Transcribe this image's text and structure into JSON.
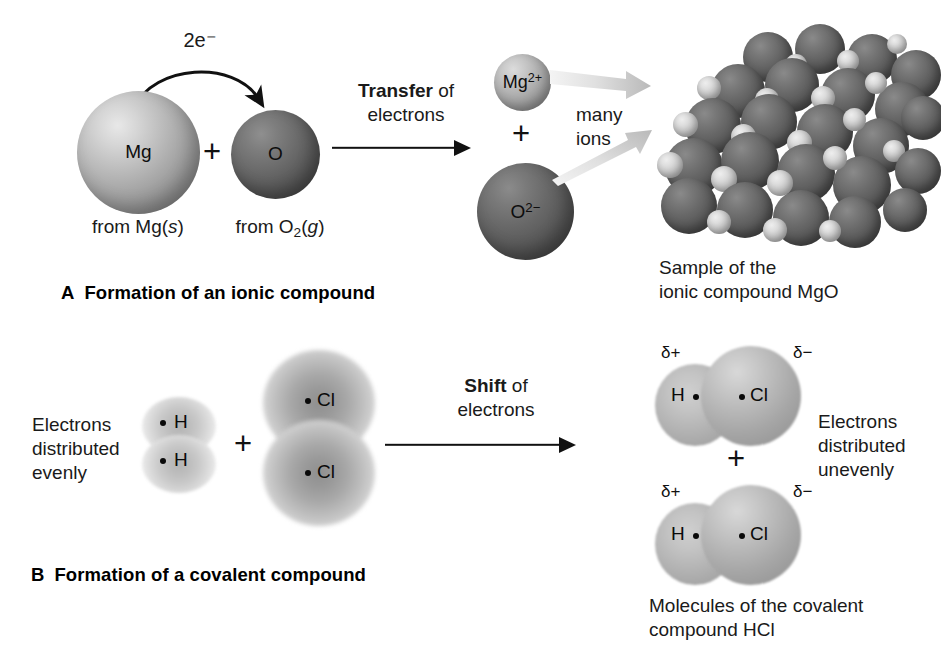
{
  "figure": {
    "panels": [
      {
        "id": "A",
        "letter": "A",
        "title": "Formation of an ionic compound",
        "reactants": {
          "atom_1": {
            "symbol": "Mg",
            "source_label_prefix": "from ",
            "source_formula": "Mg",
            "source_state": "s"
          },
          "plus": "+",
          "atom_2": {
            "symbol": "O",
            "source_label_prefix": "from ",
            "source_formula": "O",
            "source_sub": "2",
            "source_state": "g"
          }
        },
        "electron_transfer": {
          "count": "2",
          "particle": "e",
          "charge": "−",
          "label": "2e⁻"
        },
        "process_arrow": {
          "bold_word": "Transfer",
          "rest": " of",
          "line2": "electrons"
        },
        "products": {
          "ion_1": {
            "symbol": "Mg",
            "charge": "2+"
          },
          "plus": "+",
          "ion_2": {
            "symbol": "O",
            "charge": "2−"
          }
        },
        "fan_label": {
          "line1": "many",
          "line2": "ions"
        },
        "crystal_caption": {
          "line1": "Sample of the",
          "line2": "ionic compound MgO"
        }
      },
      {
        "id": "B",
        "letter": "B",
        "title": "Formation of a covalent compound",
        "left_note": {
          "line1": "Electrons",
          "line2": "distributed",
          "line3": "evenly"
        },
        "reactants": {
          "molecule_1": {
            "formula": "H2",
            "atoms": [
              "H",
              "H"
            ]
          },
          "plus": "+",
          "molecule_2": {
            "formula": "Cl2",
            "atoms": [
              "Cl",
              "Cl"
            ]
          }
        },
        "process_arrow": {
          "bold_word": "Shift",
          "rest": " of",
          "line2": "electrons"
        },
        "products": {
          "molecules": [
            {
              "formula": "HCl",
              "left_atom": "H",
              "right_atom": "Cl",
              "left_partial": "δ+",
              "right_partial": "δ−"
            },
            {
              "formula": "HCl",
              "left_atom": "H",
              "right_atom": "Cl",
              "left_partial": "δ+",
              "right_partial": "δ−"
            }
          ],
          "plus": "+"
        },
        "right_note": {
          "line1": "Electrons",
          "line2": "distributed",
          "line3": "unevenly"
        },
        "product_caption": {
          "line1": "Molecules of the covalent",
          "line2": "compound HCl"
        }
      }
    ],
    "colors": {
      "background": "#ffffff",
      "text": "#1a1a1a",
      "arrow": "#111111",
      "mg_atom_light": "#d6d6d6",
      "mg_atom_dark": "#6f6f6f",
      "o_atom_light": "#8f8f8f",
      "o_atom_dark": "#464646",
      "fan_arrow": "#d9d9d9",
      "cloud_pale": "#c9c9c9",
      "cloud_dark": "#8f8f8f"
    }
  }
}
